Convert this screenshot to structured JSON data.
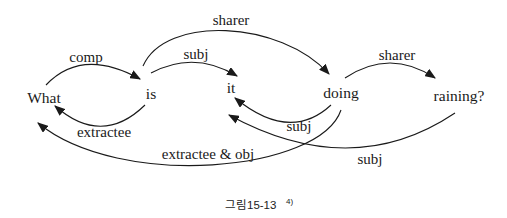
{
  "diagram": {
    "title_hint": "dependency-structure figure for the sentence: What is it doing raining?",
    "words": [
      {
        "text": "What"
      },
      {
        "text": "is"
      },
      {
        "text": "it"
      },
      {
        "text": "doing"
      },
      {
        "text": "raining?"
      }
    ],
    "relations": [
      {
        "label": "comp",
        "from": "What",
        "to": "is"
      },
      {
        "label": "subj",
        "from": "is",
        "to": "it"
      },
      {
        "label": "sharer",
        "from": "is",
        "to": "doing"
      },
      {
        "label": "sharer",
        "from": "doing",
        "to": "raining?"
      },
      {
        "label": "extractee",
        "from": "is",
        "to": "What"
      },
      {
        "label": "subj",
        "from": "doing",
        "to": "it"
      },
      {
        "label": "extractee & obj",
        "from": "doing",
        "to": "What"
      },
      {
        "label": "subj",
        "from": "raining?",
        "to": "it"
      }
    ],
    "caption": {
      "text": "그림15-13",
      "superscript": "4)"
    },
    "colors": {
      "ink": "#1a1a1a",
      "background": "#ffffff"
    }
  }
}
